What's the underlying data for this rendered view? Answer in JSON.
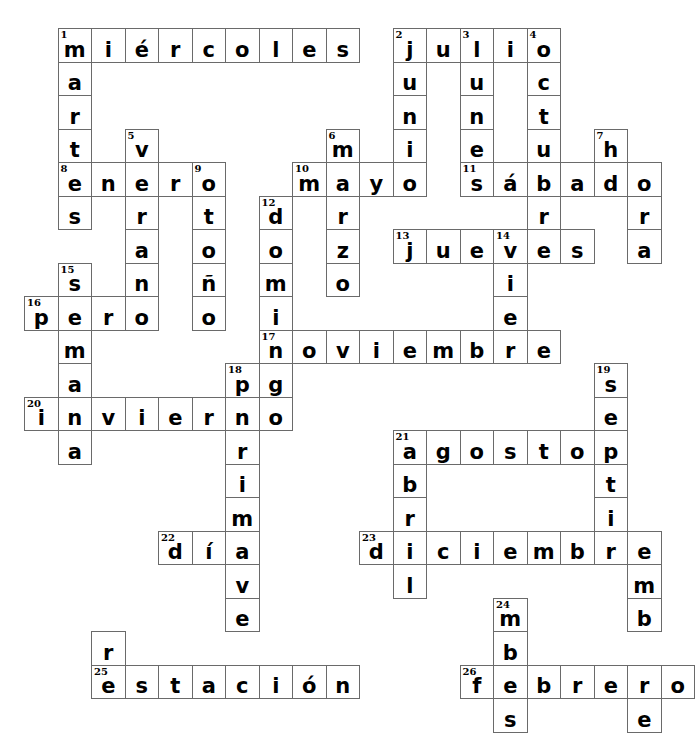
{
  "puzzle": {
    "type": "crossword",
    "title": "Spanish Calendar Crossword",
    "grid": {
      "origin_x": 24,
      "origin_y": 28,
      "cell_size": 33.5,
      "columns": 20,
      "rows": 20
    },
    "entries": [
      {
        "number": "1",
        "answer": "miércoles",
        "direction": "across",
        "row": 0,
        "col": 1
      },
      {
        "number": "1",
        "answer": "martes",
        "direction": "down",
        "row": 0,
        "col": 1
      },
      {
        "number": "2",
        "answer": "julio",
        "direction": "across",
        "row": 0,
        "col": 11
      },
      {
        "number": "2",
        "answer": "junio",
        "direction": "down",
        "row": 0,
        "col": 11
      },
      {
        "number": "3",
        "answer": "lunes",
        "direction": "down",
        "row": 0,
        "col": 13
      },
      {
        "number": "4",
        "answer": "octubre",
        "direction": "down",
        "row": 0,
        "col": 15
      },
      {
        "number": "5",
        "answer": "verano",
        "direction": "down",
        "row": 3,
        "col": 3
      },
      {
        "number": "6",
        "answer": "marzo",
        "direction": "down",
        "row": 3,
        "col": 9
      },
      {
        "number": "7",
        "answer": "hora",
        "direction": "down",
        "row": 3,
        "col": 17
      },
      {
        "number": "8",
        "answer": "enero",
        "direction": "across",
        "row": 4,
        "col": 1
      },
      {
        "number": "9",
        "answer": "otoño",
        "direction": "down",
        "row": 4,
        "col": 5
      },
      {
        "number": "10",
        "answer": "mayo",
        "direction": "across",
        "row": 4,
        "col": 8
      },
      {
        "number": "11",
        "answer": "sábado",
        "direction": "across",
        "row": 4,
        "col": 13
      },
      {
        "number": "12",
        "answer": "domingo",
        "direction": "down",
        "row": 5,
        "col": 7
      },
      {
        "number": "13",
        "answer": "jueves",
        "direction": "across",
        "row": 6,
        "col": 11
      },
      {
        "number": "14",
        "answer": "viernes",
        "direction": "down",
        "row": 6,
        "col": 14
      },
      {
        "number": "15",
        "answer": "semana",
        "direction": "down",
        "row": 7,
        "col": 1
      },
      {
        "number": "16",
        "answer": "pero",
        "direction": "across",
        "row": 8,
        "col": 0
      },
      {
        "number": "17",
        "answer": "noviembre",
        "direction": "across",
        "row": 9,
        "col": 7
      },
      {
        "number": "18",
        "answer": "primavera",
        "direction": "down",
        "row": 10,
        "col": 6
      },
      {
        "number": "19",
        "answer": "septiembre",
        "direction": "down",
        "row": 10,
        "col": 17
      },
      {
        "number": "20",
        "answer": "invierno",
        "direction": "across",
        "row": 11,
        "col": 0
      },
      {
        "number": "21",
        "answer": "agosto",
        "direction": "across",
        "row": 12,
        "col": 11
      },
      {
        "number": "21",
        "answer": "abril",
        "direction": "down",
        "row": 12,
        "col": 11
      },
      {
        "number": "22",
        "answer": "día",
        "direction": "across",
        "row": 14,
        "col": 4
      },
      {
        "number": "23",
        "answer": "diciembre",
        "direction": "across",
        "row": 15,
        "col": 10
      },
      {
        "number": "24",
        "answer": "mes",
        "direction": "down",
        "row": 17,
        "col": 14
      },
      {
        "number": "25",
        "answer": "estación",
        "direction": "across",
        "row": 18,
        "col": 3
      },
      {
        "number": "26",
        "answer": "febrero",
        "direction": "across",
        "row": 18,
        "col": 13
      }
    ],
    "cells": [
      {
        "r": 0,
        "c": 1,
        "l": "m",
        "n": "1"
      },
      {
        "r": 0,
        "c": 2,
        "l": "i"
      },
      {
        "r": 0,
        "c": 3,
        "l": "é"
      },
      {
        "r": 0,
        "c": 4,
        "l": "r"
      },
      {
        "r": 0,
        "c": 5,
        "l": "c"
      },
      {
        "r": 0,
        "c": 6,
        "l": "o"
      },
      {
        "r": 0,
        "c": 7,
        "l": "l"
      },
      {
        "r": 0,
        "c": 8,
        "l": "e"
      },
      {
        "r": 0,
        "c": 9,
        "l": "s"
      },
      {
        "r": 0,
        "c": 11,
        "l": "j",
        "n": "2"
      },
      {
        "r": 0,
        "c": 12,
        "l": "u"
      },
      {
        "r": 0,
        "c": 13,
        "l": "l",
        "n": "3"
      },
      {
        "r": 0,
        "c": 14,
        "l": "i"
      },
      {
        "r": 0,
        "c": 15,
        "l": "o",
        "n": "4"
      },
      {
        "r": 1,
        "c": 1,
        "l": "a"
      },
      {
        "r": 1,
        "c": 11,
        "l": "u"
      },
      {
        "r": 1,
        "c": 13,
        "l": "u"
      },
      {
        "r": 1,
        "c": 15,
        "l": "c"
      },
      {
        "r": 2,
        "c": 1,
        "l": "r"
      },
      {
        "r": 2,
        "c": 11,
        "l": "n"
      },
      {
        "r": 2,
        "c": 13,
        "l": "n"
      },
      {
        "r": 2,
        "c": 15,
        "l": "t"
      },
      {
        "r": 3,
        "c": 1,
        "l": "t"
      },
      {
        "r": 3,
        "c": 3,
        "l": "v",
        "n": "5"
      },
      {
        "r": 3,
        "c": 9,
        "l": "m",
        "n": "6"
      },
      {
        "r": 3,
        "c": 11,
        "l": "i"
      },
      {
        "r": 3,
        "c": 13,
        "l": "e"
      },
      {
        "r": 3,
        "c": 15,
        "l": "u"
      },
      {
        "r": 3,
        "c": 17,
        "l": "h",
        "n": "7"
      },
      {
        "r": 4,
        "c": 1,
        "l": "e",
        "n": "8"
      },
      {
        "r": 4,
        "c": 2,
        "l": "n"
      },
      {
        "r": 4,
        "c": 3,
        "l": "e"
      },
      {
        "r": 4,
        "c": 4,
        "l": "r"
      },
      {
        "r": 4,
        "c": 5,
        "l": "o",
        "n": "9"
      },
      {
        "r": 4,
        "c": 8,
        "l": "m",
        "n": "10"
      },
      {
        "r": 4,
        "c": 9,
        "l": "a"
      },
      {
        "r": 4,
        "c": 10,
        "l": "y"
      },
      {
        "r": 4,
        "c": 11,
        "l": "o"
      },
      {
        "r": 4,
        "c": 13,
        "l": "s",
        "n": "11"
      },
      {
        "r": 4,
        "c": 14,
        "l": "á"
      },
      {
        "r": 4,
        "c": 15,
        "l": "b"
      },
      {
        "r": 4,
        "c": 16,
        "l": "a"
      },
      {
        "r": 4,
        "c": 17,
        "l": "d"
      },
      {
        "r": 4,
        "c": 18,
        "l": "o"
      },
      {
        "r": 5,
        "c": 1,
        "l": "s"
      },
      {
        "r": 5,
        "c": 3,
        "l": "r"
      },
      {
        "r": 5,
        "c": 5,
        "l": "t"
      },
      {
        "r": 5,
        "c": 7,
        "l": "d",
        "n": "12"
      },
      {
        "r": 5,
        "c": 9,
        "l": "r"
      },
      {
        "r": 5,
        "c": 15,
        "l": "r"
      },
      {
        "r": 5,
        "c": 18,
        "l": "r"
      },
      {
        "r": 6,
        "c": 3,
        "l": "a"
      },
      {
        "r": 6,
        "c": 5,
        "l": "o"
      },
      {
        "r": 6,
        "c": 7,
        "l": "o"
      },
      {
        "r": 6,
        "c": 9,
        "l": "z"
      },
      {
        "r": 6,
        "c": 11,
        "l": "j",
        "n": "13"
      },
      {
        "r": 6,
        "c": 12,
        "l": "u"
      },
      {
        "r": 6,
        "c": 13,
        "l": "e"
      },
      {
        "r": 6,
        "c": 14,
        "l": "v",
        "n": "14"
      },
      {
        "r": 6,
        "c": 15,
        "l": "e"
      },
      {
        "r": 6,
        "c": 16,
        "l": "s"
      },
      {
        "r": 6,
        "c": 18,
        "l": "a"
      },
      {
        "r": 7,
        "c": 1,
        "l": "s",
        "n": "15"
      },
      {
        "r": 7,
        "c": 3,
        "l": "n"
      },
      {
        "r": 7,
        "c": 5,
        "l": "ñ"
      },
      {
        "r": 7,
        "c": 7,
        "l": "m"
      },
      {
        "r": 7,
        "c": 9,
        "l": "o"
      },
      {
        "r": 7,
        "c": 14,
        "l": "i"
      },
      {
        "r": 8,
        "c": 0,
        "l": "p",
        "n": "16"
      },
      {
        "r": 8,
        "c": 1,
        "l": "e"
      },
      {
        "r": 8,
        "c": 2,
        "l": "r"
      },
      {
        "r": 8,
        "c": 3,
        "l": "o"
      },
      {
        "r": 8,
        "c": 5,
        "l": "o"
      },
      {
        "r": 8,
        "c": 7,
        "l": "i"
      },
      {
        "r": 8,
        "c": 14,
        "l": "e"
      },
      {
        "r": 9,
        "c": 1,
        "l": "m"
      },
      {
        "r": 9,
        "c": 7,
        "l": "n",
        "n": "17"
      },
      {
        "r": 9,
        "c": 8,
        "l": "o"
      },
      {
        "r": 9,
        "c": 9,
        "l": "v"
      },
      {
        "r": 9,
        "c": 10,
        "l": "i"
      },
      {
        "r": 9,
        "c": 11,
        "l": "e"
      },
      {
        "r": 9,
        "c": 12,
        "l": "m"
      },
      {
        "r": 9,
        "c": 13,
        "l": "b"
      },
      {
        "r": 9,
        "c": 14,
        "l": "r"
      },
      {
        "r": 9,
        "c": 15,
        "l": "e"
      },
      {
        "r": 10,
        "c": 1,
        "l": "a"
      },
      {
        "r": 10,
        "c": 6,
        "l": "p",
        "n": "18"
      },
      {
        "r": 10,
        "c": 7,
        "l": "g"
      },
      {
        "r": 10,
        "c": 17,
        "l": "s",
        "n": "19"
      },
      {
        "r": 11,
        "c": 0,
        "l": "i",
        "n": "20"
      },
      {
        "r": 11,
        "c": 1,
        "l": "n"
      },
      {
        "r": 11,
        "c": 2,
        "l": "v"
      },
      {
        "r": 11,
        "c": 3,
        "l": "i"
      },
      {
        "r": 11,
        "c": 4,
        "l": "e"
      },
      {
        "r": 11,
        "c": 5,
        "l": "r"
      },
      {
        "r": 11,
        "c": 6,
        "l": "n"
      },
      {
        "r": 11,
        "c": 7,
        "l": "o"
      },
      {
        "r": 11,
        "c": 17,
        "l": "e"
      },
      {
        "r": 12,
        "c": 1,
        "l": "a"
      },
      {
        "r": 12,
        "c": 6,
        "l": "r"
      },
      {
        "r": 12,
        "c": 11,
        "l": "a",
        "n": "21"
      },
      {
        "r": 12,
        "c": 12,
        "l": "g"
      },
      {
        "r": 12,
        "c": 13,
        "l": "o"
      },
      {
        "r": 12,
        "c": 14,
        "l": "s"
      },
      {
        "r": 12,
        "c": 15,
        "l": "t"
      },
      {
        "r": 12,
        "c": 16,
        "l": "o"
      },
      {
        "r": 12,
        "c": 17,
        "l": "p"
      },
      {
        "r": 13,
        "c": 6,
        "l": "i"
      },
      {
        "r": 13,
        "c": 11,
        "l": "b"
      },
      {
        "r": 13,
        "c": 17,
        "l": "t"
      },
      {
        "r": 14,
        "c": 6,
        "l": "m"
      },
      {
        "r": 14,
        "c": 11,
        "l": "r"
      },
      {
        "r": 14,
        "c": 17,
        "l": "i"
      },
      {
        "r": 15,
        "c": 4,
        "l": "d",
        "n": "22"
      },
      {
        "r": 15,
        "c": 5,
        "l": "í"
      },
      {
        "r": 15,
        "c": 6,
        "l": "a"
      },
      {
        "r": 15,
        "c": 10,
        "l": "d",
        "n": "23"
      },
      {
        "r": 15,
        "c": 11,
        "l": "i"
      },
      {
        "r": 15,
        "c": 12,
        "l": "c"
      },
      {
        "r": 15,
        "c": 13,
        "l": "i"
      },
      {
        "r": 15,
        "c": 14,
        "l": "e"
      },
      {
        "r": 15,
        "c": 15,
        "l": "m"
      },
      {
        "r": 15,
        "c": 16,
        "l": "b"
      },
      {
        "r": 15,
        "c": 17,
        "l": "r"
      },
      {
        "r": 15,
        "c": 18,
        "l": "e"
      },
      {
        "r": 16,
        "c": 6,
        "l": "v"
      },
      {
        "r": 16,
        "c": 11,
        "l": "l"
      },
      {
        "r": 16,
        "c": 18,
        "l": "m"
      },
      {
        "r": 17,
        "c": 6,
        "l": "e"
      },
      {
        "r": 17,
        "c": 14,
        "l": "m",
        "n": "24"
      },
      {
        "r": 17,
        "c": 18,
        "l": "b"
      },
      {
        "r": 18,
        "c": 2,
        "l": "r"
      },
      {
        "r": 18,
        "c": 14,
        "l": "b"
      },
      {
        "r": 19,
        "c": 2,
        "l": "e",
        "n": "25"
      },
      {
        "r": 19,
        "c": 3,
        "l": "s"
      },
      {
        "r": 19,
        "c": 4,
        "l": "t"
      },
      {
        "r": 19,
        "c": 5,
        "l": "a"
      },
      {
        "r": 19,
        "c": 6,
        "l": "c"
      },
      {
        "r": 19,
        "c": 7,
        "l": "i"
      },
      {
        "r": 19,
        "c": 8,
        "l": "ó"
      },
      {
        "r": 19,
        "c": 9,
        "l": "n"
      },
      {
        "r": 19,
        "c": 13,
        "l": "f",
        "n": "26"
      },
      {
        "r": 19,
        "c": 14,
        "l": "e"
      },
      {
        "r": 19,
        "c": 15,
        "l": "b"
      },
      {
        "r": 19,
        "c": 16,
        "l": "r"
      },
      {
        "r": 19,
        "c": 17,
        "l": "e"
      },
      {
        "r": 19,
        "c": 18,
        "l": "r"
      },
      {
        "r": 19,
        "c": 19,
        "l": "o"
      },
      {
        "r": 20,
        "c": 14,
        "l": "s"
      },
      {
        "r": 20,
        "c": 18,
        "l": "e"
      }
    ]
  }
}
